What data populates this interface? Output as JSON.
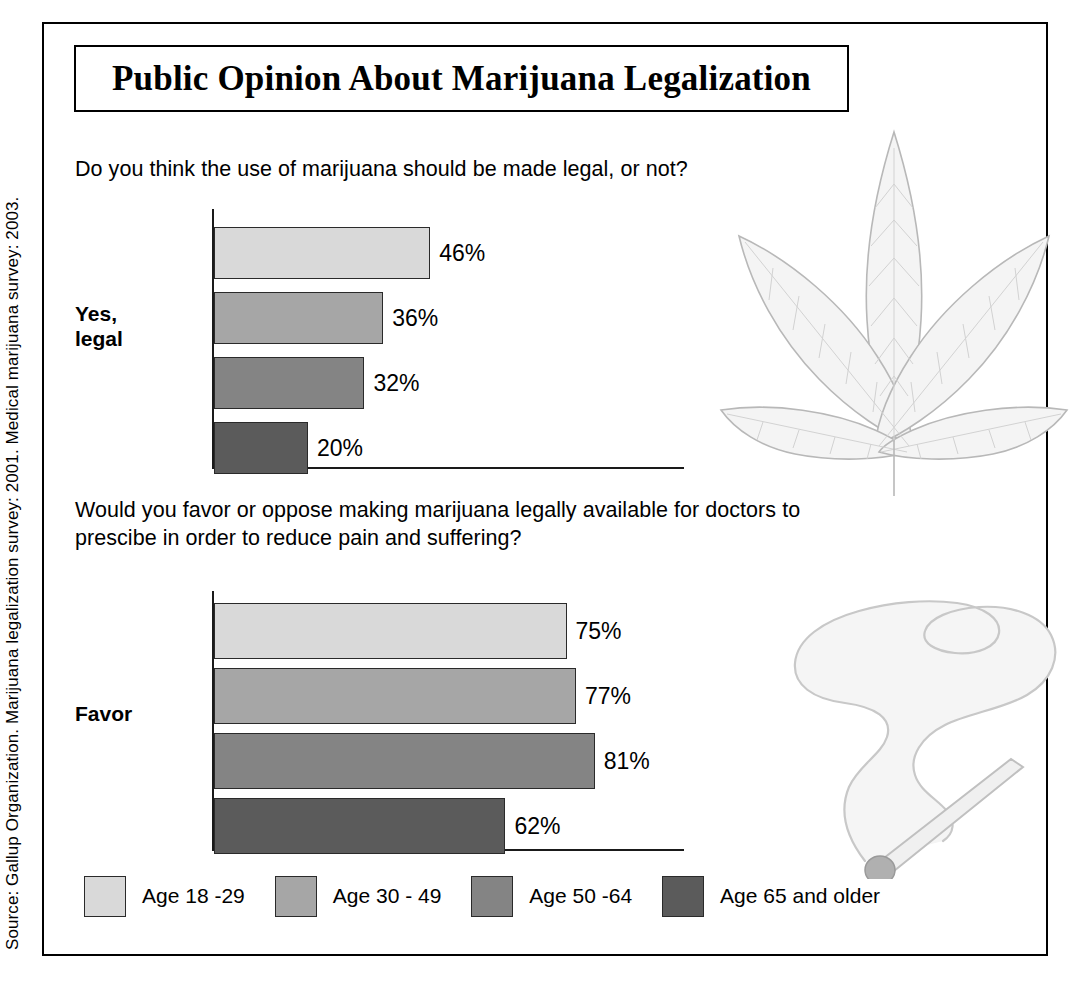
{
  "title": "Public Opinion About Marijuana Legalization",
  "source": "Source: Gallup Organization. Marijuana legalization survey: 2001. Medical marijuana survey: 2003.",
  "questions": {
    "q1": "Do you think the use of marijuana should be made legal, or not?",
    "q2": "Would you favor or oppose making marijuana legally available for doctors to prescibe in order to reduce pain and suffering?"
  },
  "legend": [
    {
      "label": "Age 18 -29",
      "color": "#d9d9d9"
    },
    {
      "label": "Age 30 - 49",
      "color": "#a6a6a6"
    },
    {
      "label": "Age 50 -64",
      "color": "#848484"
    },
    {
      "label": "Age 65 and older",
      "color": "#5b5b5b"
    }
  ],
  "chart_data": [
    {
      "type": "bar",
      "title": "Do you think the use of marijuana should be made legal, or not?",
      "category": "Yes,\nlegal",
      "category_label": "Yes, legal",
      "orientation": "horizontal",
      "categories": [
        "Age 18 -29",
        "Age 30 - 49",
        "Age 50 -64",
        "Age 65 and older"
      ],
      "values": [
        46,
        36,
        32,
        20
      ],
      "value_labels": [
        "46%",
        "36%",
        "32%",
        "20%"
      ],
      "colors": [
        "#d9d9d9",
        "#a6a6a6",
        "#848484",
        "#5b5b5b"
      ],
      "xlabel": "",
      "ylabel": "",
      "xlim": [
        0,
        100
      ],
      "grid": false,
      "legend_position": "bottom"
    },
    {
      "type": "bar",
      "title": "Would you favor or oppose making marijuana legally available for doctors to prescibe in order to reduce pain and suffering?",
      "category": "Favor",
      "category_label": "Favor",
      "orientation": "horizontal",
      "categories": [
        "Age 18 -29",
        "Age 30 - 49",
        "Age 50 -64",
        "Age 65 and older"
      ],
      "values": [
        75,
        77,
        81,
        62
      ],
      "value_labels": [
        "75%",
        "77%",
        "81%",
        "62%"
      ],
      "colors": [
        "#d9d9d9",
        "#a6a6a6",
        "#848484",
        "#5b5b5b"
      ],
      "xlabel": "",
      "ylabel": "",
      "xlim": [
        0,
        100
      ],
      "grid": false,
      "legend_position": "bottom"
    }
  ],
  "artwork": {
    "leaf": "cannabis-leaf-illustration",
    "smoke": "lit-joint-with-smoke-illustration"
  }
}
